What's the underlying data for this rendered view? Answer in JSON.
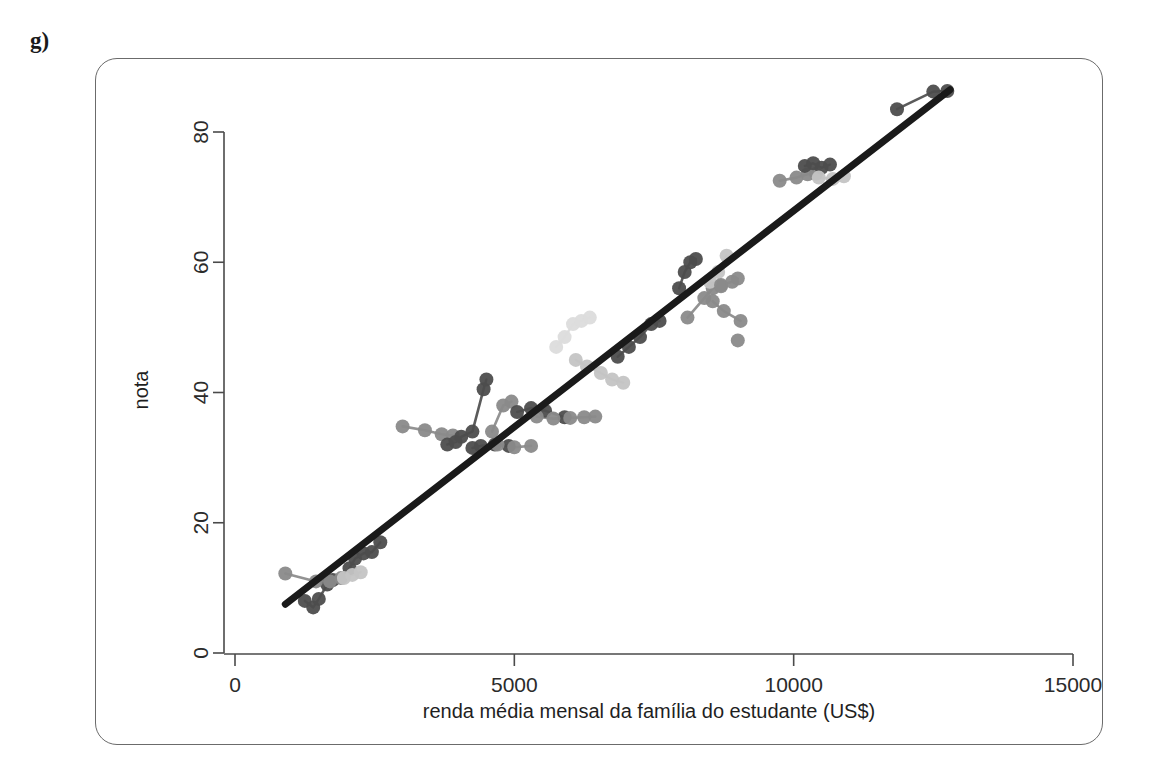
{
  "panel": {
    "label": "g)"
  },
  "chart_data": {
    "type": "scatter",
    "title": "",
    "subtitle": "",
    "xlabel": "renda média mensal da família do estudante (US$)",
    "ylabel": "nota",
    "xlim": [
      0,
      15000
    ],
    "ylim": [
      0,
      90
    ],
    "xticks": [
      0,
      5000,
      10000,
      15000
    ],
    "xticklabels": [
      "0",
      "5000",
      "10000",
      "15000"
    ],
    "yticks": [
      0,
      20,
      40,
      60,
      80
    ],
    "yticklabels": [
      "0",
      "20",
      "40",
      "60",
      "80"
    ],
    "grid": false,
    "legend": null,
    "legend_position": "none",
    "point_radius": 7,
    "colors": {
      "regression_line": "#1a1a1a",
      "point_dark": "#4d4d4d",
      "point_mid": "#8a8a8a",
      "point_light": "#c4c4c4",
      "point_verylight": "#dcdcdc",
      "connector": "#9a9a9a",
      "axis": "#4a4a4a",
      "frame": "#6b6b6b"
    },
    "regression_line": {
      "label": "linha de regressão",
      "x": [
        900,
        12800
      ],
      "y": [
        7.5,
        86.5
      ],
      "width": 7
    },
    "groups": [
      {
        "name": "grupo-1",
        "shade": "dark",
        "points": [
          {
            "x": 1250,
            "y": 8.0
          },
          {
            "x": 1400,
            "y": 7.0
          },
          {
            "x": 1500,
            "y": 8.3
          },
          {
            "x": 1650,
            "y": 10.5
          },
          {
            "x": 1750,
            "y": 11.2
          }
        ]
      },
      {
        "name": "grupo-2",
        "shade": "mid",
        "points": [
          {
            "x": 900,
            "y": 12.2
          },
          {
            "x": 1450,
            "y": 11.0
          },
          {
            "x": 1700,
            "y": 11.0
          },
          {
            "x": 1900,
            "y": 11.5
          }
        ]
      },
      {
        "name": "grupo-3",
        "shade": "dark",
        "points": [
          {
            "x": 2050,
            "y": 13.0
          },
          {
            "x": 2150,
            "y": 14.5
          },
          {
            "x": 2300,
            "y": 15.3
          },
          {
            "x": 2450,
            "y": 15.5
          },
          {
            "x": 2600,
            "y": 17.0
          }
        ]
      },
      {
        "name": "grupo-4",
        "shade": "light",
        "points": [
          {
            "x": 1950,
            "y": 11.5
          },
          {
            "x": 2100,
            "y": 12.0
          },
          {
            "x": 2250,
            "y": 12.4
          }
        ]
      },
      {
        "name": "grupo-5",
        "shade": "mid",
        "points": [
          {
            "x": 3000,
            "y": 34.8
          },
          {
            "x": 3400,
            "y": 34.2
          },
          {
            "x": 3700,
            "y": 33.6
          },
          {
            "x": 3900,
            "y": 33.4
          }
        ]
      },
      {
        "name": "grupo-6",
        "shade": "dark",
        "points": [
          {
            "x": 3800,
            "y": 32.0
          },
          {
            "x": 3950,
            "y": 32.4
          },
          {
            "x": 4050,
            "y": 33.2
          },
          {
            "x": 4250,
            "y": 34.0
          },
          {
            "x": 4450,
            "y": 40.5
          },
          {
            "x": 4500,
            "y": 42.0
          }
        ]
      },
      {
        "name": "grupo-7",
        "shade": "dark",
        "points": [
          {
            "x": 4250,
            "y": 31.5
          },
          {
            "x": 4400,
            "y": 31.8
          },
          {
            "x": 4650,
            "y": 32.0
          },
          {
            "x": 4900,
            "y": 31.8
          }
        ]
      },
      {
        "name": "grupo-8",
        "shade": "mid",
        "points": [
          {
            "x": 4700,
            "y": 32.0
          },
          {
            "x": 5000,
            "y": 31.6
          },
          {
            "x": 5300,
            "y": 31.8
          }
        ]
      },
      {
        "name": "grupo-9",
        "shade": "mid",
        "points": [
          {
            "x": 4600,
            "y": 34.0
          },
          {
            "x": 4800,
            "y": 38.0
          },
          {
            "x": 4950,
            "y": 38.6
          }
        ]
      },
      {
        "name": "grupo-10",
        "shade": "dark",
        "points": [
          {
            "x": 5050,
            "y": 37.0
          },
          {
            "x": 5300,
            "y": 37.6
          },
          {
            "x": 5550,
            "y": 37.2
          },
          {
            "x": 5900,
            "y": 36.2
          }
        ]
      },
      {
        "name": "grupo-11",
        "shade": "mid",
        "points": [
          {
            "x": 5400,
            "y": 36.3
          },
          {
            "x": 5700,
            "y": 36.0
          },
          {
            "x": 6000,
            "y": 36.1
          },
          {
            "x": 6250,
            "y": 36.2
          },
          {
            "x": 6450,
            "y": 36.3
          }
        ]
      },
      {
        "name": "grupo-12",
        "shade": "verylight",
        "points": [
          {
            "x": 5750,
            "y": 47.0
          },
          {
            "x": 5900,
            "y": 48.5
          },
          {
            "x": 6050,
            "y": 50.5
          },
          {
            "x": 6200,
            "y": 51.0
          },
          {
            "x": 6350,
            "y": 51.5
          }
        ]
      },
      {
        "name": "grupo-13",
        "shade": "light",
        "points": [
          {
            "x": 6100,
            "y": 45.0
          },
          {
            "x": 6300,
            "y": 44.0
          },
          {
            "x": 6550,
            "y": 43.0
          },
          {
            "x": 6750,
            "y": 42.0
          },
          {
            "x": 6950,
            "y": 41.5
          }
        ]
      },
      {
        "name": "grupo-14",
        "shade": "dark",
        "points": [
          {
            "x": 6850,
            "y": 45.5
          },
          {
            "x": 7050,
            "y": 47.0
          },
          {
            "x": 7250,
            "y": 48.5
          },
          {
            "x": 7450,
            "y": 50.5
          },
          {
            "x": 7600,
            "y": 51.0
          }
        ]
      },
      {
        "name": "grupo-15",
        "shade": "dark",
        "points": [
          {
            "x": 7950,
            "y": 56.0
          },
          {
            "x": 8050,
            "y": 58.5
          },
          {
            "x": 8150,
            "y": 60.0
          },
          {
            "x": 8250,
            "y": 60.5
          }
        ]
      },
      {
        "name": "grupo-16",
        "shade": "mid",
        "points": [
          {
            "x": 8100,
            "y": 51.5
          },
          {
            "x": 8400,
            "y": 54.5
          },
          {
            "x": 8550,
            "y": 56.0
          },
          {
            "x": 8700,
            "y": 56.3
          }
        ]
      },
      {
        "name": "grupo-17",
        "shade": "light",
        "points": [
          {
            "x": 8500,
            "y": 57.0
          },
          {
            "x": 8650,
            "y": 58.5
          },
          {
            "x": 8800,
            "y": 61.0
          }
        ]
      },
      {
        "name": "grupo-18",
        "shade": "mid",
        "points": [
          {
            "x": 8700,
            "y": 56.5
          },
          {
            "x": 8900,
            "y": 57.0
          },
          {
            "x": 9000,
            "y": 57.5
          }
        ]
      },
      {
        "name": "grupo-19",
        "shade": "mid",
        "points": [
          {
            "x": 8550,
            "y": 54.0
          },
          {
            "x": 8750,
            "y": 52.5
          },
          {
            "x": 9050,
            "y": 51.0
          }
        ]
      },
      {
        "name": "grupo-20",
        "shade": "mid",
        "points": [
          {
            "x": 9000,
            "y": 48.0
          }
        ]
      },
      {
        "name": "grupo-21",
        "shade": "mid",
        "points": [
          {
            "x": 9750,
            "y": 72.5
          },
          {
            "x": 10050,
            "y": 73.0
          },
          {
            "x": 10250,
            "y": 73.5
          },
          {
            "x": 10400,
            "y": 73.6
          }
        ]
      },
      {
        "name": "grupo-22",
        "shade": "dark",
        "points": [
          {
            "x": 10200,
            "y": 74.8
          },
          {
            "x": 10350,
            "y": 75.2
          },
          {
            "x": 10500,
            "y": 74.5
          },
          {
            "x": 10650,
            "y": 75.0
          }
        ]
      },
      {
        "name": "grupo-23",
        "shade": "light",
        "points": [
          {
            "x": 10450,
            "y": 73.0
          },
          {
            "x": 10700,
            "y": 72.8
          },
          {
            "x": 10900,
            "y": 73.2
          }
        ]
      },
      {
        "name": "grupo-24",
        "shade": "dark",
        "points": [
          {
            "x": 11850,
            "y": 83.5
          },
          {
            "x": 12500,
            "y": 86.2
          },
          {
            "x": 12750,
            "y": 86.3
          }
        ]
      }
    ]
  }
}
